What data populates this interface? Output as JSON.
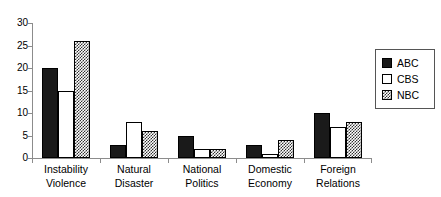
{
  "chart_data": {
    "type": "bar",
    "title": "",
    "subtitle": "",
    "xlabel": "",
    "ylabel": "",
    "ylim": [
      0,
      30
    ],
    "yticks": [
      0,
      5,
      10,
      15,
      20,
      25,
      30
    ],
    "grid": false,
    "legend_position": "right",
    "categories": [
      "Instability Violence",
      "Natural Disaster",
      "National Politics",
      "Domestic Economy",
      "Foreign Relations"
    ],
    "category_lines": [
      [
        "Instability",
        "Violence"
      ],
      [
        "Natural",
        "Disaster"
      ],
      [
        "National",
        "Politics"
      ],
      [
        "Domestic",
        "Economy"
      ],
      [
        "Foreign",
        "Relations"
      ]
    ],
    "series": [
      {
        "name": "ABC",
        "color": "#1a1a1a",
        "pattern": "solid-black",
        "values": [
          20,
          3,
          5,
          3,
          10
        ]
      },
      {
        "name": "CBS",
        "color": "#ffffff",
        "pattern": "open-white",
        "values": [
          15,
          8,
          2,
          1,
          7
        ]
      },
      {
        "name": "NBC",
        "color": "#808080",
        "pattern": "checker-gray",
        "values": [
          26,
          6,
          2,
          4,
          8
        ]
      }
    ]
  },
  "legend": {
    "items": [
      {
        "label": "ABC"
      },
      {
        "label": "CBS"
      },
      {
        "label": "NBC"
      }
    ]
  },
  "axis": {
    "y_tick_labels": [
      "0",
      "5",
      "10",
      "15",
      "20",
      "25",
      "30"
    ]
  }
}
